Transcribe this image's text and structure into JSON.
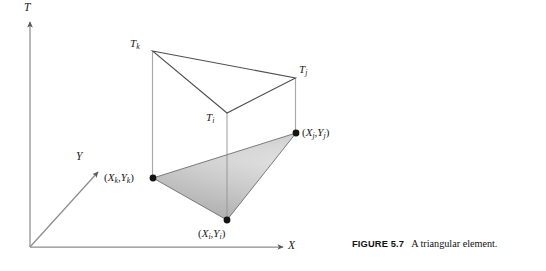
{
  "figure": {
    "caption_label": "FIGURE 5.7",
    "caption_text": "A triangular element.",
    "background_color": "#ffffff",
    "line_color": "#555555",
    "axis_color": "#808080",
    "dot_color": "#111111",
    "fill_light": "#e2e2e2",
    "fill_mid": "#c9c9c9",
    "fill_dark": "#a9a9a9"
  },
  "axes": [
    {
      "name": "T",
      "label": "T",
      "direction": "vertical-up"
    },
    {
      "name": "X",
      "label": "X",
      "direction": "horizontal-right"
    },
    {
      "name": "Y",
      "label": "Y",
      "direction": "diagonal-up-right"
    }
  ],
  "nodes": [
    {
      "id": "i",
      "temperature_label_main": "T",
      "temperature_label_sub": "i",
      "coord_open": "(",
      "coord_x_main": "X",
      "coord_x_sub": "i",
      "coord_comma": ",",
      "coord_y_main": "Y",
      "coord_y_sub": "i",
      "coord_close": ")"
    },
    {
      "id": "j",
      "temperature_label_main": "T",
      "temperature_label_sub": "j",
      "coord_open": "(",
      "coord_x_main": "X",
      "coord_x_sub": "j",
      "coord_comma": ",",
      "coord_y_main": "Y",
      "coord_y_sub": "j",
      "coord_close": ")"
    },
    {
      "id": "k",
      "temperature_label_main": "T",
      "temperature_label_sub": "k",
      "coord_open": "(",
      "coord_x_main": "X",
      "coord_x_sub": "k",
      "coord_comma": ",",
      "coord_y_main": "Y",
      "coord_y_sub": "k",
      "coord_close": ")"
    }
  ]
}
